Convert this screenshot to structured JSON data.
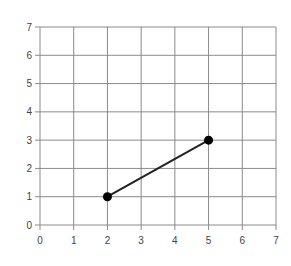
{
  "chart_data": {
    "type": "line",
    "title": "",
    "xlabel": "",
    "ylabel": "",
    "xlim": [
      0,
      7
    ],
    "ylim": [
      0,
      7
    ],
    "grid": true,
    "legend": null,
    "x_ticks": [
      "0",
      "1",
      "2",
      "3",
      "4",
      "5",
      "6",
      "7"
    ],
    "y_ticks": [
      "0",
      "1",
      "2",
      "3",
      "4",
      "5",
      "6",
      "7"
    ],
    "series": [
      {
        "name": "segment",
        "points": [
          {
            "x": 2,
            "y": 1
          },
          {
            "x": 5,
            "y": 3
          }
        ],
        "markers": true
      }
    ]
  },
  "colors": {
    "grid": "#8a8a8a",
    "line": "#222222",
    "marker": "#000000",
    "label": "#444444"
  }
}
